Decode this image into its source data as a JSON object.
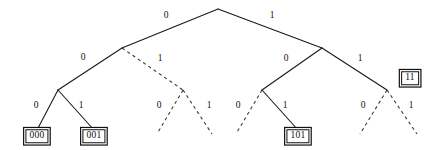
{
  "figure": {
    "type": "binary-code-tree",
    "width": 428,
    "height": 150,
    "background_color": "#ffffff",
    "line_color": "#1a1a1a",
    "dashed_line_color": "#3a3a3a",
    "text_color": "#111111"
  },
  "nodes": {
    "root": {
      "x": 218,
      "y": 9
    },
    "n0": {
      "x": 122,
      "y": 48
    },
    "n1": {
      "x": 322,
      "y": 48
    },
    "n00": {
      "x": 58,
      "y": 90
    },
    "n01": {
      "x": 183,
      "y": 90
    },
    "n10": {
      "x": 262,
      "y": 90
    },
    "n11": {
      "x": 387,
      "y": 90
    },
    "n000": {
      "x": 37,
      "y": 130
    },
    "n001": {
      "x": 94,
      "y": 130
    },
    "n010": {
      "x": 157,
      "y": 134
    },
    "n011": {
      "x": 212,
      "y": 134
    },
    "n100": {
      "x": 236,
      "y": 134
    },
    "n101": {
      "x": 298,
      "y": 130
    },
    "n110": {
      "x": 360,
      "y": 134
    },
    "n111": {
      "x": 417,
      "y": 134
    }
  },
  "edges": [
    {
      "name": "edge-root-0",
      "from": "root",
      "to": "n0",
      "style": "solid",
      "label": "0",
      "label_x": 166,
      "label_y": 16
    },
    {
      "name": "edge-root-1",
      "from": "root",
      "to": "n1",
      "style": "solid",
      "label": "1",
      "label_x": 272,
      "label_y": 16
    },
    {
      "name": "edge-0-00",
      "from": "n0",
      "to": "n00",
      "style": "solid",
      "label": "0",
      "label_x": 83,
      "label_y": 58
    },
    {
      "name": "edge-0-01",
      "from": "n0",
      "to": "n01",
      "style": "dashed",
      "label": "1",
      "label_x": 160,
      "label_y": 59
    },
    {
      "name": "edge-1-10",
      "from": "n1",
      "to": "n10",
      "style": "solid",
      "label": "0",
      "label_x": 286,
      "label_y": 59
    },
    {
      "name": "edge-1-11",
      "from": "n1",
      "to": "n11",
      "style": "solid",
      "label": "1",
      "label_x": 360,
      "label_y": 59
    },
    {
      "name": "edge-00-000",
      "from": "n00",
      "to": "n000",
      "style": "solid",
      "label": "0",
      "label_x": 36,
      "label_y": 106
    },
    {
      "name": "edge-00-001",
      "from": "n00",
      "to": "n001",
      "style": "solid",
      "label": "1",
      "label_x": 81,
      "label_y": 106
    },
    {
      "name": "edge-01-010",
      "from": "n01",
      "to": "n010",
      "style": "dashed",
      "label": "0",
      "label_x": 159,
      "label_y": 106
    },
    {
      "name": "edge-01-011",
      "from": "n01",
      "to": "n011",
      "style": "dashed",
      "label": "1",
      "label_x": 209,
      "label_y": 106
    },
    {
      "name": "edge-10-100",
      "from": "n10",
      "to": "n100",
      "style": "dashed",
      "label": "0",
      "label_x": 238,
      "label_y": 106
    },
    {
      "name": "edge-10-101",
      "from": "n10",
      "to": "n101",
      "style": "solid",
      "label": "1",
      "label_x": 285,
      "label_y": 106
    },
    {
      "name": "edge-11-110",
      "from": "n11",
      "to": "n110",
      "style": "dashed",
      "label": "0",
      "label_x": 363,
      "label_y": 106
    },
    {
      "name": "edge-11-111",
      "from": "n11",
      "to": "n111",
      "style": "dashed",
      "label": "1",
      "label_x": 411,
      "label_y": 106
    }
  ],
  "codewords": [
    {
      "name": "codeword-000",
      "label": "000",
      "x": 37,
      "y": 136
    },
    {
      "name": "codeword-001",
      "label": "001",
      "x": 94,
      "y": 136
    },
    {
      "name": "codeword-101",
      "label": "101",
      "x": 298,
      "y": 136
    },
    {
      "name": "codeword-11",
      "label": "11",
      "x": 410,
      "y": 78
    }
  ]
}
